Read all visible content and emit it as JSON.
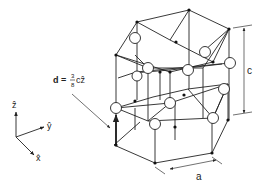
{
  "diagram": {
    "labels": {
      "displacement_prefix": "d =",
      "displacement_num": "3",
      "displacement_den": "8",
      "displacement_suffix": "cẑ",
      "lattice_c": "c",
      "lattice_a": "a",
      "axis_z": "ẑ",
      "axis_y": "ŷ",
      "axis_x": "x̂"
    },
    "colors": {
      "line": "#222222",
      "atom_fill": "#ffffff",
      "background": "#ffffff"
    }
  }
}
